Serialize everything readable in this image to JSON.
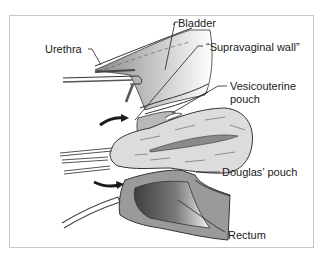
{
  "labels": {
    "bladder": "Bladder",
    "urethra": "Urethra",
    "supravaginal_wall": "“Supravaginal wall”",
    "vesicouterine_line1": "Vesicouterine",
    "vesicouterine_line2": "pouch",
    "douglas": "Douglas’ pouch",
    "rectum": "Rectum"
  },
  "colors": {
    "frame": "#c8c8c8",
    "tissue_light": "#d9d9d9",
    "tissue_mid": "#a8a8a8",
    "tissue_dark": "#555555",
    "outline": "#333333"
  }
}
